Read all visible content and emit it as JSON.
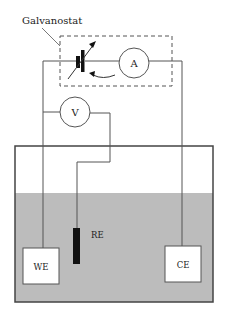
{
  "labels": {
    "galvanostat": "Galvanostat",
    "ammeter": "A",
    "voltmeter": "V",
    "reference_electrode": "RE",
    "working_electrode": "WE",
    "counter_electrode": "CE"
  },
  "colors": {
    "line": "#555555",
    "electrolyte": "#bcbcbc",
    "container_border": "#444444",
    "electrode_box": "#ffffff",
    "reference_electrode": "#111111",
    "background": "#ffffff"
  }
}
